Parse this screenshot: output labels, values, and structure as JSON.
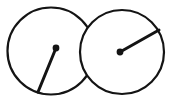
{
  "figure": {
    "canvas": {
      "width": 173,
      "height": 104,
      "background": "#ffffff"
    },
    "stroke_color": "#141414",
    "fill_color": "#ffffff",
    "outline_stroke_width": 2.2,
    "needle_stroke_width": 3.0,
    "shapes": [
      {
        "name": "left-circle",
        "type": "circle",
        "cx": 51,
        "cy": 51,
        "r": 43.5,
        "label": "Left circle"
      },
      {
        "name": "right-circle",
        "type": "circle",
        "cx": 122,
        "cy": 52,
        "r": 42,
        "label": "Right circle"
      }
    ],
    "needles": [
      {
        "name": "left-needle",
        "pivot": {
          "x": 56,
          "y": 48
        },
        "tip": {
          "x": 38,
          "y": 92
        },
        "dot_radius": 3.4,
        "label": "Left needle pointing down-left"
      },
      {
        "name": "right-needle",
        "pivot": {
          "x": 120,
          "y": 52
        },
        "tip": {
          "x": 159,
          "y": 30
        },
        "dot_radius": 3.4,
        "label": "Right needle pointing up-right"
      }
    ]
  },
  "chart_data": {
    "type": "scatter",
    "title": "",
    "xlabel": "",
    "ylabel": "",
    "series": [
      {
        "name": "left-dial",
        "center": [
          51,
          51
        ],
        "radius": 43.5,
        "pivot": [
          56,
          48
        ],
        "tip": [
          38,
          92
        ],
        "angle_deg": 247.7
      },
      {
        "name": "right-dial",
        "center": [
          122,
          52
        ],
        "radius": 42,
        "pivot": [
          120,
          52
        ],
        "tip": [
          159,
          30
        ],
        "angle_deg": 29.4
      }
    ]
  }
}
